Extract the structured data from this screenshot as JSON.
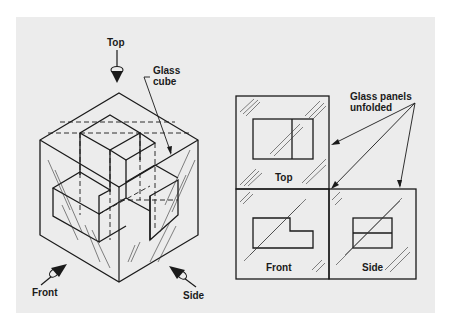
{
  "figure": {
    "background": "#ececec",
    "ink": "#1a1a1a",
    "isometric_view": {
      "labels": {
        "top": "Top",
        "glass_cube_line1": "Glass",
        "glass_cube_line2": "cube",
        "front": "Front",
        "side": "Side"
      },
      "viewing_arrows": [
        "Top",
        "Front",
        "Side"
      ]
    },
    "unfolded_view": {
      "callout_line1": "Glass panels",
      "callout_line2": "unfolded",
      "panels": [
        {
          "name": "Top",
          "label": "Top"
        },
        {
          "name": "Front",
          "label": "Front"
        },
        {
          "name": "Side",
          "label": "Side"
        }
      ]
    }
  }
}
